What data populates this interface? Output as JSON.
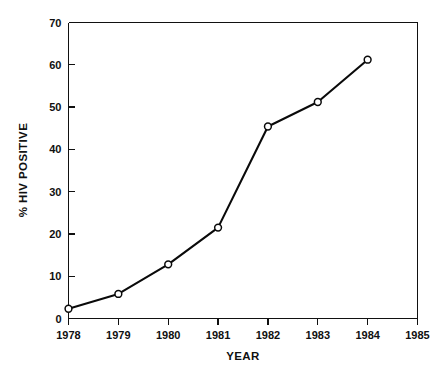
{
  "chart_data": {
    "type": "line",
    "title": "",
    "subtitle": "",
    "xlabel": "YEAR",
    "ylabel": "% HIV POSITIVE",
    "x": [
      1978,
      1979,
      1980,
      1981,
      1982,
      1983,
      1984
    ],
    "values": [
      2.3,
      5.8,
      12.8,
      21.5,
      45.4,
      51.2,
      61.2
    ],
    "series": [
      {
        "name": "% HIV POSITIVE",
        "x": [
          1978,
          1979,
          1980,
          1981,
          1982,
          1983,
          1984
        ],
        "values": [
          2.3,
          5.8,
          12.8,
          21.5,
          45.4,
          51.2,
          61.2
        ],
        "marker": "open-circle",
        "color": "#0a0a0a"
      }
    ],
    "xlim": [
      1978,
      1985
    ],
    "ylim": [
      0,
      70
    ],
    "xticks": [
      1978,
      1979,
      1980,
      1981,
      1982,
      1983,
      1984,
      1985
    ],
    "xtick_labels": [
      "1978",
      "1979",
      "1980",
      "1981",
      "1982",
      "1983",
      "1984",
      "1985"
    ],
    "yticks": [
      0,
      10,
      20,
      30,
      40,
      50,
      60,
      70
    ],
    "ytick_labels": [
      "0",
      "10",
      "20",
      "30",
      "40",
      "50",
      "60",
      "70"
    ],
    "grid": false,
    "legend": false,
    "legend_position": "none",
    "annotations": [],
    "background_color": "#ffffff",
    "line_color": "#0a0a0a",
    "marker_fill_color": "#ffffff",
    "axis_color": "#111111"
  }
}
